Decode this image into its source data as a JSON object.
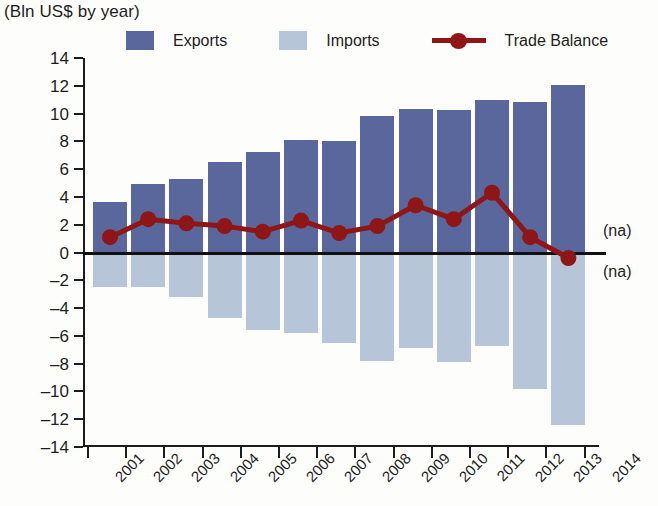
{
  "header": {
    "title_clipped": "",
    "subtitle": "(Bln US$ by year)"
  },
  "legend": {
    "position": "top",
    "items": [
      {
        "label": "Exports",
        "marker": "square-swatch",
        "color": "#5a679c"
      },
      {
        "label": "Imports",
        "marker": "square-swatch",
        "color": "#b7c5d9"
      },
      {
        "label": "Trade Balance",
        "marker": "line-with-circle",
        "color": "#8e1616"
      }
    ]
  },
  "annotations": {
    "na_top": "(na)",
    "na_bottom": "(na)"
  },
  "chart_data": {
    "type": "bar",
    "title": "",
    "subtitle": "(Bln US$ by year)",
    "xlabel": "",
    "ylabel": "",
    "ylim": [
      -14,
      14
    ],
    "ytick_step": 2,
    "yticks": [
      14,
      12,
      10,
      8,
      6,
      4,
      2,
      0,
      -2,
      -4,
      -6,
      -8,
      -10,
      -12,
      -14
    ],
    "ytick_labels": [
      "14",
      "12",
      "10",
      "8",
      "6",
      "4",
      "2",
      "0",
      "–2",
      "–4",
      "–6",
      "–8",
      "–10",
      "–12",
      "–14"
    ],
    "grid": false,
    "categories": [
      "2001",
      "2002",
      "2003",
      "2004",
      "2005",
      "2006",
      "2007",
      "2008",
      "2009",
      "2010",
      "2011",
      "2012",
      "2013",
      "2014"
    ],
    "series": [
      {
        "name": "Exports",
        "type": "bar",
        "color": "#5a679c",
        "values": [
          3.6,
          4.9,
          5.3,
          6.5,
          7.2,
          8.1,
          8.0,
          9.8,
          10.3,
          10.25,
          11.0,
          10.85,
          12.05,
          null
        ]
      },
      {
        "name": "Imports",
        "type": "bar",
        "color": "#b7c5d9",
        "values": [
          -2.5,
          -2.5,
          -3.2,
          -4.7,
          -5.6,
          -5.8,
          -6.5,
          -7.8,
          -6.9,
          -7.9,
          -6.7,
          -9.8,
          -12.4,
          null
        ]
      },
      {
        "name": "Trade Balance",
        "type": "line",
        "color": "#8e1616",
        "values": [
          1.1,
          2.4,
          2.1,
          1.9,
          1.5,
          2.3,
          1.4,
          1.9,
          3.4,
          2.4,
          4.3,
          1.1,
          -0.4,
          null
        ]
      }
    ]
  }
}
